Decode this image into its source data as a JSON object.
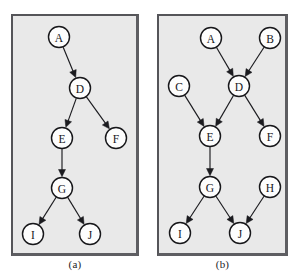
{
  "figure": {
    "background_color": "#ffffff",
    "panel_fill": "#e9e9e9",
    "panel_border_color": "#555559",
    "node_fill": "#fdfdfd",
    "node_stroke": "#17171a",
    "edge_color": "#1b1b1f",
    "node_radius": 10.5
  },
  "panels": [
    {
      "id": "a",
      "caption": "(a)",
      "nodes": [
        {
          "label": "A",
          "x": 46,
          "y": 21
        },
        {
          "label": "D",
          "x": 67,
          "y": 72
        },
        {
          "label": "E",
          "x": 49,
          "y": 122
        },
        {
          "label": "F",
          "x": 103,
          "y": 122
        },
        {
          "label": "G",
          "x": 49,
          "y": 172
        },
        {
          "label": "I",
          "x": 20,
          "y": 218
        },
        {
          "label": "J",
          "x": 77,
          "y": 218
        }
      ],
      "edges": [
        {
          "from": "A",
          "to": "D"
        },
        {
          "from": "D",
          "to": "E"
        },
        {
          "from": "D",
          "to": "F"
        },
        {
          "from": "E",
          "to": "G"
        },
        {
          "from": "G",
          "to": "I"
        },
        {
          "from": "G",
          "to": "J"
        }
      ]
    },
    {
      "id": "b",
      "caption": "(b)",
      "nodes": [
        {
          "label": "A",
          "x": 52,
          "y": 22
        },
        {
          "label": "B",
          "x": 111,
          "y": 22
        },
        {
          "label": "C",
          "x": 20,
          "y": 70
        },
        {
          "label": "D",
          "x": 80,
          "y": 70
        },
        {
          "label": "E",
          "x": 51,
          "y": 120
        },
        {
          "label": "F",
          "x": 111,
          "y": 120
        },
        {
          "label": "G",
          "x": 51,
          "y": 171
        },
        {
          "label": "H",
          "x": 111,
          "y": 171
        },
        {
          "label": "I",
          "x": 21,
          "y": 217
        },
        {
          "label": "J",
          "x": 81,
          "y": 217
        }
      ],
      "edges": [
        {
          "from": "A",
          "to": "D"
        },
        {
          "from": "B",
          "to": "D"
        },
        {
          "from": "C",
          "to": "E"
        },
        {
          "from": "D",
          "to": "E"
        },
        {
          "from": "D",
          "to": "F"
        },
        {
          "from": "E",
          "to": "G"
        },
        {
          "from": "G",
          "to": "I"
        },
        {
          "from": "G",
          "to": "J"
        },
        {
          "from": "H",
          "to": "J"
        }
      ]
    }
  ]
}
